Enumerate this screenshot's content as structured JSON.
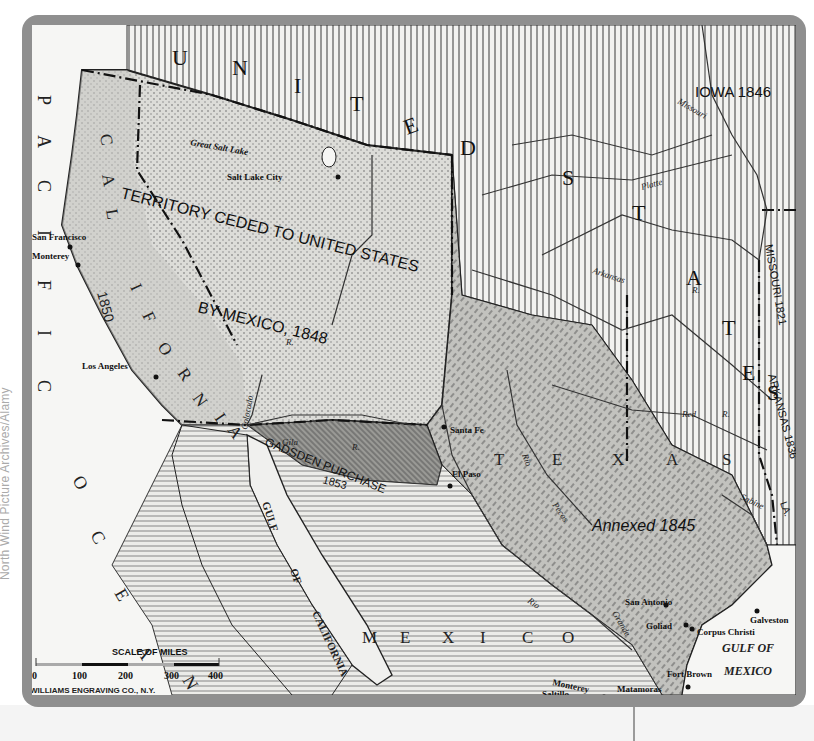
{
  "credit": "North Wind Picture Archives/Alamy",
  "colors": {
    "frame": "#8f8f8f",
    "ocean": "#f6f6f4",
    "us_hatch": "#555555",
    "cession": "#d9d9d6",
    "texas": "#bdbdb9",
    "gadsden": "#8a8a86",
    "mexico": "#e6e6e2",
    "ink": "#1a1a1a"
  },
  "map": {
    "regions": {
      "united_states": "U N I T E D   S T A T E S",
      "us_letters": [
        "U",
        "N",
        "I",
        "T",
        "E",
        "D",
        "S",
        "T",
        "A",
        "T",
        "E",
        "S"
      ],
      "cession_line1": "TERRITORY CEDED TO UNITED STATES",
      "cession_line2": "BY MEXICO, 1848",
      "california_letters": [
        "C",
        "A",
        "L",
        "I",
        "F",
        "O",
        "R",
        "N",
        "I",
        "A"
      ],
      "california_year": "1850",
      "gadsden_name": "GADSDEN PURCHASE",
      "gadsden_year": "1853",
      "texas_letters": [
        "T",
        "E",
        "X",
        "A",
        "S"
      ],
      "texas_annexed": "Annexed 1845",
      "mexico_letters": [
        "M",
        "E",
        "X",
        "I",
        "C",
        "O"
      ],
      "iowa": "IOWA 1846",
      "missouri_state": "MISSOURI 1821",
      "arkansas_state": "ARKANSAS 1836",
      "louisiana_abbr": "LA."
    },
    "oceans": {
      "pacific_letters": [
        "P",
        "A",
        "C",
        "I",
        "F",
        "I",
        "C"
      ],
      "ocean_letters": [
        "O",
        "C",
        "E",
        "A",
        "N"
      ],
      "gulf_of_mexico_line1": "GULF OF",
      "gulf_of_mexico_line2": "MEXICO",
      "gulf_of_california_1": "GULF",
      "gulf_of_california_2": "OF",
      "gulf_of_california_3": "CALIFORNIA"
    },
    "rivers": {
      "missouri": "Missouri",
      "platte": "Platte",
      "arkansas": "Arkansas",
      "colorado": "Colorado",
      "gila": "Gila",
      "red": "Red",
      "pecos": "Pecos",
      "rio_grande_1": "Rio",
      "rio_grande_2": "Grande",
      "rio_pecos": "Rio",
      "sabine": "Sabine",
      "r": "R."
    },
    "cities": {
      "great_salt_lake": "Great Salt Lake",
      "salt_lake_city": "Salt Lake City",
      "san_francisco": "San Francisco",
      "monterey_ca": "Monterey",
      "los_angeles": "Los Angeles",
      "santa_fe": "Santa Fe",
      "el_paso": "El Paso",
      "san_antonio": "San Antonio",
      "goliad": "Goliad",
      "galveston": "Galveston",
      "corpus_christi": "Corpus Christi",
      "fort_brown": "Fort Brown",
      "matamoras": "Matamoras",
      "monterey_mx": "Monterey",
      "saltillo": "Saltillo"
    },
    "scale": {
      "title": "SCALE OF MILES",
      "ticks": [
        "0",
        "100",
        "200",
        "300",
        "400"
      ]
    },
    "engraver": "WILLIAMS ENGRAVING CO., N.Y."
  }
}
